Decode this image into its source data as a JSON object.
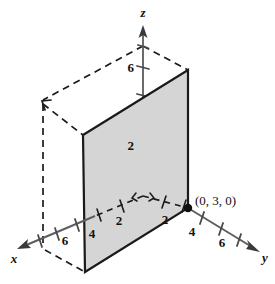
{
  "figure": {
    "kind": "3d-coordinate-plane-diagram",
    "background_color": "#ffffff",
    "plane_fill_color": "#d5d5d5",
    "stroke_color": "#1a1a1a",
    "axes": [
      {
        "name": "x",
        "label": "x"
      },
      {
        "name": "y",
        "label": "y"
      },
      {
        "name": "z",
        "label": "z"
      }
    ],
    "axis_labels": {
      "x": "x",
      "y": "y",
      "z": "z"
    },
    "tick_labels": {
      "z_upper_6": "6",
      "z_inner_2": "2",
      "x_inner_2": "2",
      "y_inner_2": "2",
      "x_at_plane_4": "4",
      "y_at_plane_4": "4",
      "x_outer_6": "6",
      "y_outer_6": "6"
    },
    "points": [
      {
        "name": "plane-anchor-point",
        "label": "(0, 3, 0)",
        "coordinates": [
          0,
          3,
          0
        ]
      }
    ]
  }
}
